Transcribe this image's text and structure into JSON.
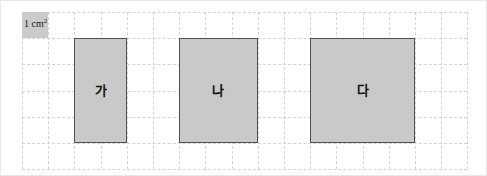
{
  "figure": {
    "width": 487,
    "height": 176,
    "background_color": "#ffffff",
    "frame_color": "#e8e8e8"
  },
  "grid": {
    "origin_x": 21,
    "origin_y": 11,
    "cell_size": 26.2,
    "columns": 17,
    "rows": 6,
    "line_color": "#d3d3d6",
    "line_style": "dashed"
  },
  "legend": {
    "name": "unit-square",
    "value": "1 cm",
    "exponent": "2",
    "fill_color": "#cbcbcb",
    "grid_col": 0,
    "grid_row": 0,
    "cells": 1
  },
  "shapes": [
    {
      "id": "ga",
      "label": "가",
      "grid_col": 2,
      "grid_row": 1,
      "cols": 2,
      "rows": 4,
      "width_cm": 2,
      "height_cm": 4,
      "area_cm2": 8,
      "fill_color": "#c9c9c9",
      "stroke_color": "#4f4f4f"
    },
    {
      "id": "na",
      "label": "나",
      "grid_col": 6,
      "grid_row": 1,
      "cols": 3,
      "rows": 4,
      "width_cm": 3,
      "height_cm": 4,
      "area_cm2": 12,
      "fill_color": "#c9c9c9",
      "stroke_color": "#4f4f4f"
    },
    {
      "id": "da",
      "label": "다",
      "grid_col": 11,
      "grid_row": 1,
      "cols": 4,
      "rows": 4,
      "width_cm": 4,
      "height_cm": 4,
      "area_cm2": 16,
      "fill_color": "#c9c9c9",
      "stroke_color": "#4f4f4f"
    }
  ]
}
